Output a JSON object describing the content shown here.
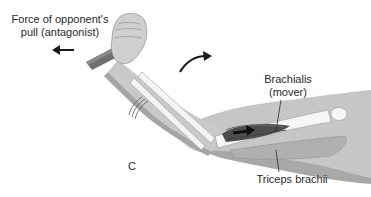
{
  "figure": {
    "panel_letter": "C",
    "labels": {
      "force": "Force of opponent's pull (antagonist)",
      "force_line1": "Force of opponent's",
      "force_line2": "pull (antagonist)",
      "brachialis_line1": "Brachialis",
      "brachialis_line2": "(mover)",
      "triceps": "Triceps brachii"
    },
    "arrows": {
      "pull_direction": "left",
      "rotation_direction": "clockwise-up-right",
      "muscle_contraction": "right"
    },
    "colors": {
      "skin": "#c9c9c9",
      "skin_shadow": "#a9a9a9",
      "bone": "#f4f4f4",
      "muscle": "#4e4e4e",
      "rod": "#6a6a6a",
      "text": "#2a2a2a",
      "arrow": "#1a1a1a"
    }
  }
}
